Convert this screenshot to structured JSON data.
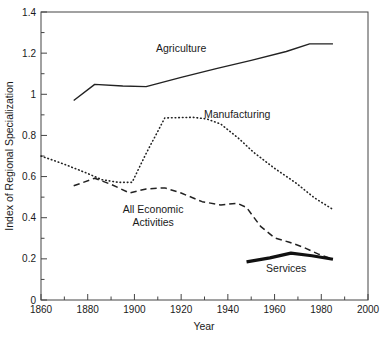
{
  "chart_data": {
    "type": "line",
    "title": "",
    "xlabel": "Year",
    "ylabel": "Index of Regional Specialization",
    "xlim": [
      1860,
      2000
    ],
    "ylim": [
      0,
      1.4
    ],
    "xticks": [
      1860,
      1880,
      1900,
      1920,
      1940,
      1960,
      1980,
      2000
    ],
    "xtick_labels": [
      "1860",
      "1880",
      "1900",
      "1920",
      "1940",
      "1960",
      "1980",
      "2000"
    ],
    "yticks": [
      0,
      0.2,
      0.4,
      0.6,
      0.8,
      1,
      1.2,
      1.4
    ],
    "ytick_labels": [
      "0",
      "0.2",
      "0.4",
      "0.6",
      "0.8",
      "1",
      "1.2",
      "1.4"
    ],
    "x_minor_step": 10,
    "y_minor_step": 0.1,
    "grid": false,
    "legend": "inline-annotations",
    "series": [
      {
        "name": "Agriculture",
        "style": "solid",
        "width": 1.4,
        "color": "#222222",
        "label_x": 1920,
        "label_y": 1.205,
        "points": [
          [
            1874,
            0.97
          ],
          [
            1883,
            1.048
          ],
          [
            1895,
            1.04
          ],
          [
            1905,
            1.037
          ],
          [
            1920,
            1.082
          ],
          [
            1935,
            1.125
          ],
          [
            1950,
            1.165
          ],
          [
            1965,
            1.208
          ],
          [
            1975,
            1.245
          ],
          [
            1985,
            1.245
          ]
        ]
      },
      {
        "name": "Manufacturing",
        "style": "dotted",
        "width": 1.6,
        "color": "#222222",
        "label_x": 1944,
        "label_y": 0.885,
        "points": [
          [
            1860,
            0.7
          ],
          [
            1870,
            0.66
          ],
          [
            1880,
            0.615
          ],
          [
            1886,
            0.585
          ],
          [
            1893,
            0.572
          ],
          [
            1899,
            0.572
          ],
          [
            1905,
            0.712
          ],
          [
            1913,
            0.885
          ],
          [
            1925,
            0.888
          ],
          [
            1931,
            0.88
          ],
          [
            1937,
            0.855
          ],
          [
            1945,
            0.782
          ],
          [
            1951,
            0.718
          ],
          [
            1960,
            0.64
          ],
          [
            1969,
            0.57
          ],
          [
            1977,
            0.497
          ],
          [
            1985,
            0.44
          ]
        ]
      },
      {
        "name": "All Economic Activities",
        "style": "dashed",
        "width": 1.5,
        "color": "#222222",
        "label_x": 1908,
        "label_y": 0.425,
        "label_line2_y": 0.36,
        "points": [
          [
            1874,
            0.555
          ],
          [
            1883,
            0.592
          ],
          [
            1890,
            0.562
          ],
          [
            1898,
            0.52
          ],
          [
            1905,
            0.54
          ],
          [
            1913,
            0.545
          ],
          [
            1920,
            0.52
          ],
          [
            1929,
            0.478
          ],
          [
            1937,
            0.462
          ],
          [
            1944,
            0.47
          ],
          [
            1948,
            0.45
          ],
          [
            1954,
            0.358
          ],
          [
            1960,
            0.302
          ],
          [
            1966,
            0.282
          ],
          [
            1972,
            0.258
          ],
          [
            1979,
            0.222
          ],
          [
            1985,
            0.198
          ]
        ]
      },
      {
        "name": "Services",
        "style": "solid",
        "width": 3.2,
        "color": "#111111",
        "label_x": 1965,
        "label_y": 0.135,
        "points": [
          [
            1948,
            0.185
          ],
          [
            1958,
            0.205
          ],
          [
            1967,
            0.228
          ],
          [
            1976,
            0.215
          ],
          [
            1985,
            0.198
          ]
        ]
      }
    ]
  },
  "labels": {
    "agriculture": "Agriculture",
    "manufacturing": "Manufacturing",
    "all_economic_1": "All Economic",
    "all_economic_2": "Activities",
    "services": "Services",
    "xaxis": "Year",
    "yaxis": "Index of Regional Specialization"
  }
}
